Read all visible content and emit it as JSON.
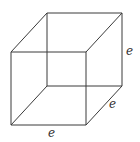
{
  "figure": {
    "type": "cube",
    "edge_color": "#3a3a3a",
    "labels": {
      "height": "e",
      "depth": "e",
      "width": "e"
    }
  }
}
